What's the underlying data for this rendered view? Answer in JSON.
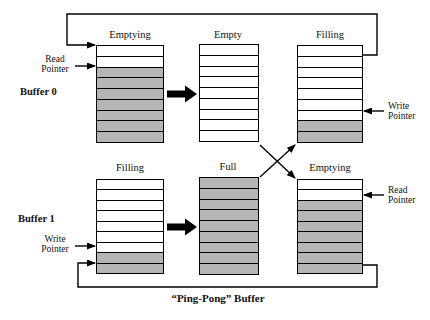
{
  "title": "“Ping-Pong” Buffer",
  "colors": {
    "filled_cell": "#b5b5b5",
    "empty_cell": "#ffffff",
    "line": "#000000"
  },
  "buffers": [
    {
      "name": "buffer0-emptying",
      "state_label": "Emptying",
      "rows": 9,
      "filled_rows": [
        2,
        3,
        4,
        5,
        6,
        7,
        8
      ]
    },
    {
      "name": "middle-top-empty",
      "state_label": "Empty",
      "rows": 9,
      "filled_rows": []
    },
    {
      "name": "right-top-filling",
      "state_label": "Filling",
      "rows": 9,
      "filled_rows": [
        7,
        8
      ]
    },
    {
      "name": "buffer1-filling",
      "state_label": "Filling",
      "rows": 9,
      "filled_rows": [
        7,
        8
      ]
    },
    {
      "name": "middle-bottom-full",
      "state_label": "Full",
      "rows": 9,
      "filled_rows": [
        0,
        1,
        2,
        3,
        4,
        5,
        6,
        7,
        8
      ]
    },
    {
      "name": "right-bottom-emptying",
      "state_label": "Emptying",
      "rows": 9,
      "filled_rows": [
        2,
        3,
        4,
        5,
        6,
        7,
        8
      ]
    }
  ],
  "side_labels": {
    "buffer0": "Buffer 0",
    "buffer1": "Buffer 1"
  },
  "pointers": {
    "buffer0_read": {
      "line1": "Read",
      "line2": "Pointer"
    },
    "buffer1_write": {
      "line1": "Write",
      "line2": "Pointer"
    },
    "right_top_write": {
      "line1": "Write",
      "line2": "Pointer"
    },
    "right_bottom_read": {
      "line1": "Read",
      "line2": "Pointer"
    }
  }
}
